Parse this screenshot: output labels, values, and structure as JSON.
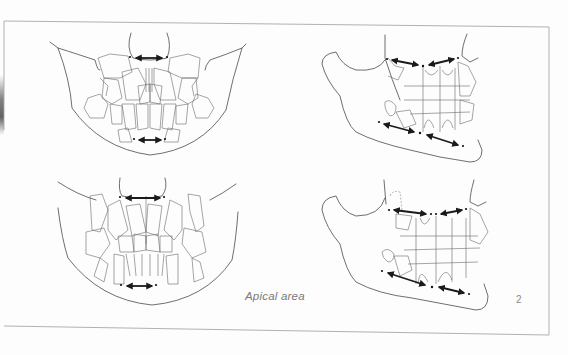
{
  "figure": {
    "number": "2",
    "caption": "Apical area",
    "panels": [
      {
        "id": "top-left",
        "view": "frontal",
        "arrows": 2
      },
      {
        "id": "top-right",
        "view": "lateral",
        "arrows": 4
      },
      {
        "id": "bottom-left",
        "view": "frontal",
        "arrows": 2
      },
      {
        "id": "bottom-right",
        "view": "lateral",
        "arrows": 4
      }
    ]
  },
  "colors": {
    "line": "#4a4a4a",
    "arrow": "#1a1a1a",
    "frame": "#a8a8a8",
    "caption": "#7a7a7a"
  }
}
